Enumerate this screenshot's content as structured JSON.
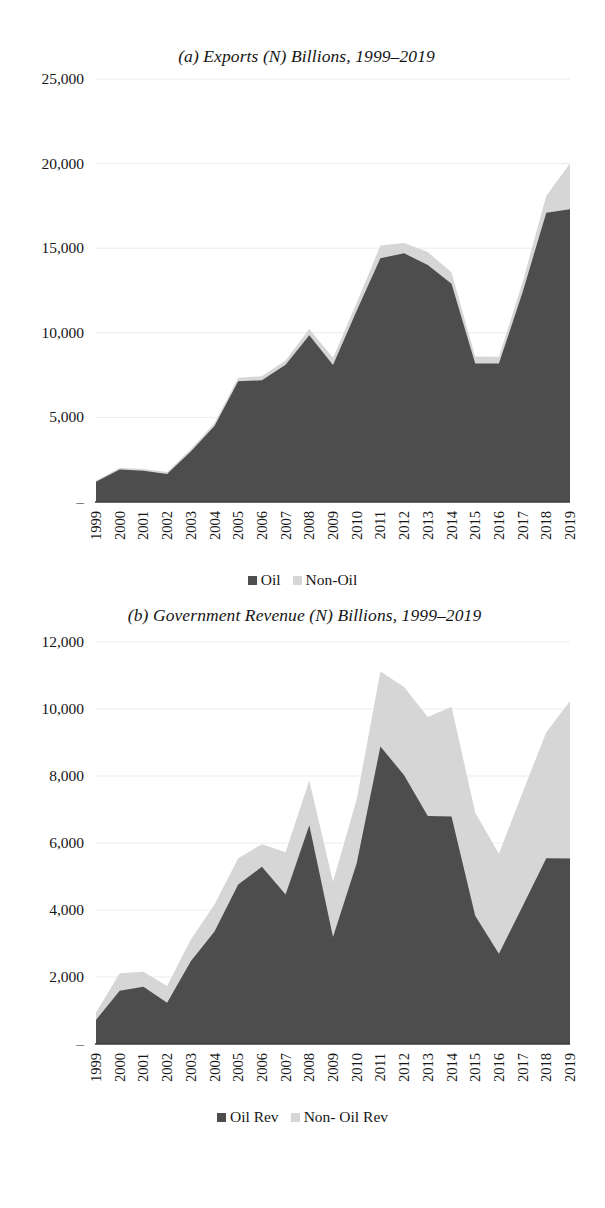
{
  "figure": {
    "charts": [
      {
        "id": "a",
        "title": "(a) Exports (N) Billions, 1999–2019",
        "legend": [
          {
            "label": "Oil",
            "color": "#4d4d4d"
          },
          {
            "label": "Non-Oil",
            "color": "#d6d6d6"
          }
        ]
      },
      {
        "id": "b",
        "title": "(b) Government Revenue (N) Billions, 1999–2019",
        "legend": [
          {
            "label": "Oil Rev",
            "color": "#4d4d4d"
          },
          {
            "label": "Non- Oil Rev",
            "color": "#d6d6d6"
          }
        ]
      }
    ]
  },
  "chart_data": [
    {
      "type": "area",
      "stacked": true,
      "id": "exports",
      "title": "(a) Exports (N) Billions, 1999–2019",
      "xlabel": "",
      "ylabel": "",
      "ylim": [
        0,
        25000
      ],
      "yticks": [
        0,
        5000,
        10000,
        15000,
        20000,
        25000
      ],
      "ytick_labels": [
        "–",
        "5,000",
        "10,000",
        "15,000",
        "20,000",
        "25,000"
      ],
      "grid": true,
      "legend_position": "bottom",
      "x": [
        1999,
        2000,
        2001,
        2002,
        2003,
        2004,
        2005,
        2006,
        2007,
        2008,
        2009,
        2010,
        2011,
        2012,
        2013,
        2014,
        2015,
        2016,
        2017,
        2018,
        2019
      ],
      "categories": [
        "1999",
        "2000",
        "2001",
        "2002",
        "2003",
        "2004",
        "2005",
        "2006",
        "2007",
        "2008",
        "2009",
        "2010",
        "2011",
        "2012",
        "2013",
        "2014",
        "2015",
        "2016",
        "2017",
        "2018",
        "2019"
      ],
      "series": [
        {
          "name": "Oil",
          "color": "#4d4d4d",
          "values": [
            1190,
            1920,
            1840,
            1650,
            2990,
            4490,
            7140,
            7190,
            8110,
            9860,
            8100,
            11300,
            14400,
            14700,
            14000,
            12900,
            8180,
            8180,
            12400,
            17100,
            17300
          ]
        },
        {
          "name": "Non-Oil",
          "color": "#d6d6d6",
          "values": [
            60,
            110,
            110,
            120,
            130,
            180,
            210,
            240,
            270,
            370,
            430,
            470,
            760,
            600,
            770,
            680,
            420,
            400,
            590,
            1000,
            2700
          ]
        }
      ]
    },
    {
      "type": "area",
      "stacked": true,
      "id": "government_revenue",
      "title": "(b) Government Revenue (N) Billions, 1999–2019",
      "xlabel": "",
      "ylabel": "",
      "ylim": [
        0,
        12000
      ],
      "yticks": [
        0,
        2000,
        4000,
        6000,
        8000,
        10000,
        12000
      ],
      "ytick_labels": [
        "–",
        "2,000",
        "4,000",
        "6,000",
        "8,000",
        "10,000",
        "12,000"
      ],
      "grid": true,
      "legend_position": "bottom",
      "x": [
        1999,
        2000,
        2001,
        2002,
        2003,
        2004,
        2005,
        2006,
        2007,
        2008,
        2009,
        2010,
        2011,
        2012,
        2013,
        2014,
        2015,
        2016,
        2017,
        2018,
        2019
      ],
      "categories": [
        "1999",
        "2000",
        "2001",
        "2002",
        "2003",
        "2004",
        "2005",
        "2006",
        "2007",
        "2008",
        "2009",
        "2010",
        "2011",
        "2012",
        "2013",
        "2014",
        "2015",
        "2016",
        "2017",
        "2018",
        "2019"
      ],
      "series": [
        {
          "name": "Oil Rev",
          "color": "#4d4d4d",
          "values": [
            720,
            1590,
            1710,
            1230,
            2470,
            3355,
            4762,
            5288,
            4462,
            6530,
            3191,
            5396,
            8879,
            8026,
            6809,
            6794,
            3831,
            2694,
            4109,
            5545,
            5537
          ]
        },
        {
          "name": "Non- Oil Rev",
          "color": "#d6d6d6",
          "values": [
            220,
            520,
            450,
            500,
            650,
            806,
            785,
            677,
            1265,
            1336,
            1652,
            1908,
            2238,
            2628,
            2951,
            3275,
            3082,
            2986,
            3400,
            3760,
            4700
          ]
        }
      ]
    }
  ]
}
